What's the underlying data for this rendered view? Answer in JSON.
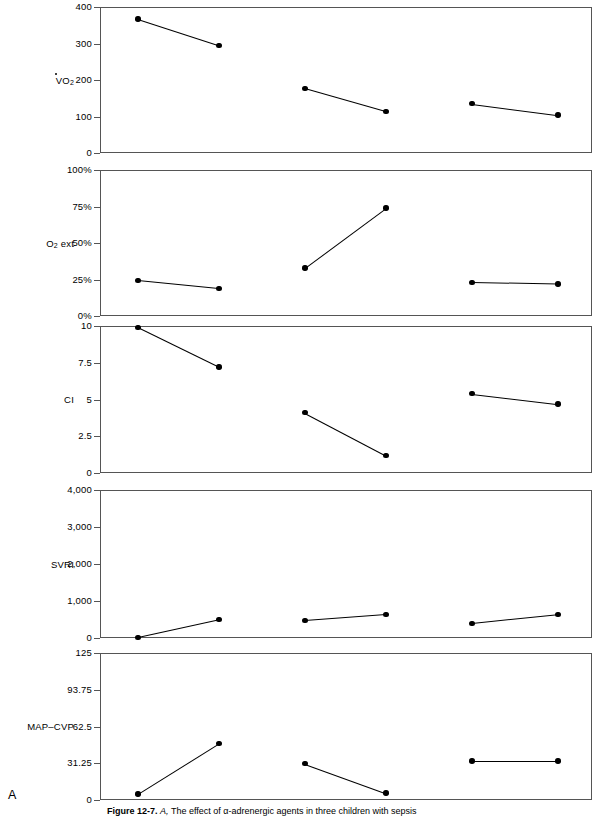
{
  "figure": {
    "panel_letter": "A",
    "caption_bold": "Figure 12-7.",
    "caption_italic": "A,",
    "caption_rest": "The effect of α-adrenergic agents in three children with sepsis"
  },
  "chart_data": {
    "type": "line",
    "title": "The effect of α-adrenergic agents in three children with sepsis",
    "layout": "5 stacked panels sharing a common unlabeled x-axis; three patient pairs (pre / post) per panel",
    "grid": false,
    "legend": "none",
    "x": [
      "patient 1 pre",
      "patient 1 post",
      "patient 2 pre",
      "patient 2 post",
      "patient 3 pre",
      "patient 3 post"
    ],
    "panels": [
      {
        "name": "vo2",
        "ylabel": "V̇O2",
        "ylabel_base": "VO",
        "ylabel_sub": "2",
        "ylim": [
          0,
          400
        ],
        "yticks": [
          0,
          100,
          200,
          300,
          400
        ],
        "yticklabels": [
          "0",
          "100",
          "200",
          "300",
          "400"
        ],
        "series": [
          {
            "name": "patient 1",
            "values": [
              367,
              295
            ]
          },
          {
            "name": "patient 2",
            "values": [
              177,
              114
            ]
          },
          {
            "name": "patient 3",
            "values": [
              135,
              104
            ]
          }
        ]
      },
      {
        "name": "o2ext",
        "ylabel": "O2 ext",
        "ylabel_base": "O",
        "ylabel_sub": "2",
        "ylabel_tail": " ext",
        "ylim": [
          0,
          100
        ],
        "yticks": [
          0,
          25,
          50,
          75,
          100
        ],
        "yticklabels": [
          "0%",
          "25%",
          "50%",
          "75%",
          "100%"
        ],
        "series": [
          {
            "name": "patient 1",
            "values": [
              24.5,
              19
            ]
          },
          {
            "name": "patient 2",
            "values": [
              33,
              74
            ]
          },
          {
            "name": "patient 3",
            "values": [
              23,
              22
            ]
          }
        ]
      },
      {
        "name": "ci",
        "ylabel": "CI",
        "ylim": [
          0,
          10
        ],
        "yticks": [
          0,
          2.5,
          5,
          7.5,
          10
        ],
        "yticklabels": [
          "0",
          "2.5",
          "5",
          "7.5",
          "10"
        ],
        "series": [
          {
            "name": "patient 1",
            "values": [
              9.9,
              7.2
            ]
          },
          {
            "name": "patient 2",
            "values": [
              4.1,
              1.2
            ]
          },
          {
            "name": "patient 3",
            "values": [
              5.4,
              4.7
            ]
          }
        ]
      },
      {
        "name": "svri",
        "ylabel": "SVRI",
        "ylim": [
          0,
          4000
        ],
        "yticks": [
          0,
          1000,
          2000,
          3000,
          4000
        ],
        "yticklabels": [
          "0",
          "1,000",
          "2,000",
          "3,000",
          "4,000"
        ],
        "series": [
          {
            "name": "patient 1",
            "values": [
              20,
              500
            ]
          },
          {
            "name": "patient 2",
            "values": [
              480,
              640
            ]
          },
          {
            "name": "patient 3",
            "values": [
              400,
              640
            ]
          }
        ]
      },
      {
        "name": "map_cvp",
        "ylabel": "MAP–CVP",
        "ylim": [
          0,
          125
        ],
        "yticks": [
          0,
          31.25,
          62.5,
          93.75,
          125
        ],
        "yticklabels": [
          "0",
          "31.25",
          "62.5",
          "93.75",
          "125"
        ],
        "series": [
          {
            "name": "patient 1",
            "values": [
              5,
              48
            ]
          },
          {
            "name": "patient 2",
            "values": [
              31,
              6
            ]
          },
          {
            "name": "patient 3",
            "values": [
              33,
              33
            ]
          }
        ]
      }
    ]
  }
}
